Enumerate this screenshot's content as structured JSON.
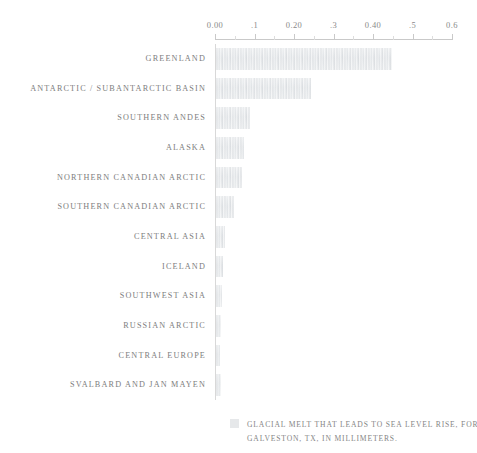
{
  "chart_data": {
    "type": "bar",
    "orientation": "horizontal",
    "title": "",
    "subtitle": "",
    "xlabel": "",
    "ylabel": "",
    "xlim": [
      0,
      0.6
    ],
    "grid": false,
    "legend_position": "bottom",
    "categories": [
      "GREENLAND",
      "ANTARCTIC / SUBANTARCTIC BASIN",
      "SOUTHERN ANDES",
      "ALASKA",
      "NORTHERN CANADIAN ARCTIC",
      "SOUTHERN CANADIAN ARCTIC",
      "CENTRAL ASIA",
      "ICELAND",
      "SOUTHWEST ASIA",
      "RUSSIAN ARCTIC",
      "CENTRAL EUROPE",
      "SVALBARD AND JAN MAYEN"
    ],
    "values": [
      0.445,
      0.24,
      0.085,
      0.07,
      0.065,
      0.045,
      0.022,
      0.018,
      0.016,
      0.013,
      0.009,
      0.012
    ],
    "tick_values": [
      0,
      0.05,
      0.1,
      0.15,
      0.2,
      0.25,
      0.3,
      0.35,
      0.4,
      0.45,
      0.5,
      0.55,
      0.6
    ],
    "tick_labels": [
      {
        "value": 0,
        "label": "0.00",
        "major": true
      },
      {
        "value": 0.05,
        "label": "",
        "major": false
      },
      {
        "value": 0.1,
        "label": ".1",
        "major": true
      },
      {
        "value": 0.15,
        "label": "",
        "major": false
      },
      {
        "value": 0.2,
        "label": "0.20",
        "major": true
      },
      {
        "value": 0.25,
        "label": "",
        "major": false
      },
      {
        "value": 0.3,
        "label": ".3",
        "major": true
      },
      {
        "value": 0.35,
        "label": "",
        "major": false
      },
      {
        "value": 0.4,
        "label": "0.40",
        "major": true
      },
      {
        "value": 0.45,
        "label": "",
        "major": false
      },
      {
        "value": 0.5,
        "label": ".5",
        "major": true
      },
      {
        "value": 0.55,
        "label": "",
        "major": false
      },
      {
        "value": 0.6,
        "label": "0.6",
        "major": true
      }
    ],
    "series": [
      {
        "name": "GLACIAL MELT THAT LEADS TO SEA LEVEL RISE, FOR GALVESTON, TX, IN MILLIMETERS.",
        "values": [
          0.445,
          0.24,
          0.085,
          0.07,
          0.065,
          0.045,
          0.022,
          0.018,
          0.016,
          0.013,
          0.009,
          0.012
        ]
      }
    ],
    "unit": "millimeters",
    "colors": {
      "bar": "#e9ebed",
      "axis": "#c9c9c9",
      "text": "#7d7d7d",
      "background": "#ffffff"
    }
  },
  "legend": {
    "line1": "GLACIAL MELT THAT LEADS TO SEA LEVEL RISE, FOR",
    "line2": "GALVESTON, TX, IN MILLIMETERS."
  }
}
